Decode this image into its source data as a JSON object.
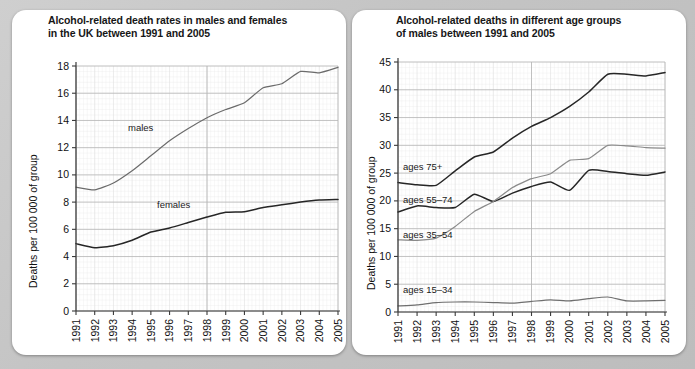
{
  "page": {
    "background_color": "#c4c4c4",
    "card_color": "#ffffff"
  },
  "left_panel": {
    "title_line1": "Alcohol-related death rates in males and females",
    "title_line2": "in the UK between 1991 and 2005",
    "y_axis_label": "Deaths per 100 000 of group",
    "series_label_males": "males",
    "series_label_females": "females"
  },
  "right_panel": {
    "title_line1": "Alcohol-related deaths in different age groups",
    "title_line2": "of males between 1991 and 2005",
    "y_axis_label": "Deaths per 100 000 of group",
    "series_label_75": "ages 75+",
    "series_label_5574": "ages 55–74",
    "series_label_3554": "ages 35–54",
    "series_label_1534": "ages 15–34"
  },
  "chart_data": [
    {
      "id": "left",
      "type": "line",
      "title": "Alcohol-related death rates in males and females in the UK between 1991 and 2005",
      "xlabel": "",
      "ylabel": "Deaths per 100 000 of group",
      "x": [
        1991,
        1992,
        1993,
        1994,
        1995,
        1996,
        1997,
        1998,
        1999,
        2000,
        2001,
        2002,
        2003,
        2004,
        2005
      ],
      "xtick_labels": [
        "1991",
        "1992",
        "1993",
        "1994",
        "1995",
        "1996",
        "1997",
        "1998",
        "1999",
        "2000",
        "2001",
        "2002",
        "2003",
        "2004",
        "2005"
      ],
      "ytick_labels": [
        "0",
        "2",
        "4",
        "6",
        "8",
        "10",
        "12",
        "14",
        "16",
        "18"
      ],
      "yticks": [
        0,
        2,
        4,
        6,
        8,
        10,
        12,
        14,
        16,
        18
      ],
      "ylim": [
        0,
        18
      ],
      "xlim": [
        1991,
        2005
      ],
      "grid": true,
      "legend": "inline-labels",
      "series": [
        {
          "name": "males",
          "color": "#6b6b6b",
          "values": [
            9.1,
            8.9,
            9.4,
            10.3,
            11.4,
            12.5,
            13.4,
            14.2,
            14.8,
            15.3,
            16.4,
            16.7,
            17.6,
            17.5,
            17.9
          ]
        },
        {
          "name": "females",
          "color": "#262626",
          "values": [
            4.95,
            4.65,
            4.8,
            5.2,
            5.8,
            6.1,
            6.5,
            6.9,
            7.25,
            7.3,
            7.6,
            7.8,
            8.0,
            8.15,
            8.2
          ]
        }
      ]
    },
    {
      "id": "right",
      "type": "line",
      "title": "Alcohol-related deaths in different age groups of males between 1991 and 2005",
      "xlabel": "",
      "ylabel": "Deaths per 100 000 of group",
      "x": [
        1991,
        1992,
        1993,
        1994,
        1995,
        1996,
        1997,
        1998,
        1999,
        2000,
        2001,
        2002,
        2003,
        2004,
        2005
      ],
      "xtick_labels": [
        "1991",
        "1992",
        "1993",
        "1994",
        "1995",
        "1996",
        "1997",
        "1998",
        "1999",
        "2000",
        "2001",
        "2002",
        "2003",
        "2004",
        "2005"
      ],
      "ytick_labels": [
        "0",
        "5",
        "10",
        "15",
        "20",
        "25",
        "30",
        "35",
        "40",
        "45"
      ],
      "yticks": [
        0,
        5,
        10,
        15,
        20,
        25,
        30,
        35,
        40,
        45
      ],
      "ylim": [
        0,
        45
      ],
      "xlim": [
        1991,
        2005
      ],
      "grid": true,
      "legend": "inline-labels",
      "series": [
        {
          "name": "ages 75+",
          "color": "#262626",
          "values": [
            23.3,
            22.9,
            22.8,
            25.4,
            27.9,
            28.8,
            31.3,
            33.4,
            35.0,
            37.0,
            39.6,
            42.8,
            42.8,
            42.5,
            43.1
          ]
        },
        {
          "name": "ages 55–74",
          "color": "#262626",
          "values": [
            18.0,
            19.1,
            18.8,
            18.8,
            21.2,
            19.9,
            21.4,
            22.6,
            23.4,
            21.9,
            25.5,
            25.3,
            24.9,
            24.6,
            25.2
          ]
        },
        {
          "name": "ages 35–54",
          "color": "#8a8a8a",
          "values": [
            13.0,
            12.9,
            13.3,
            15.4,
            18.1,
            19.9,
            22.4,
            24.0,
            24.9,
            27.3,
            27.6,
            30.0,
            29.9,
            29.6,
            29.5
          ]
        },
        {
          "name": "ages 15–34",
          "color": "#6f6f6f",
          "values": [
            1.1,
            1.3,
            1.7,
            1.8,
            1.8,
            1.7,
            1.6,
            1.9,
            2.2,
            2.0,
            2.4,
            2.7,
            2.0,
            2.0,
            2.1
          ]
        }
      ]
    }
  ]
}
